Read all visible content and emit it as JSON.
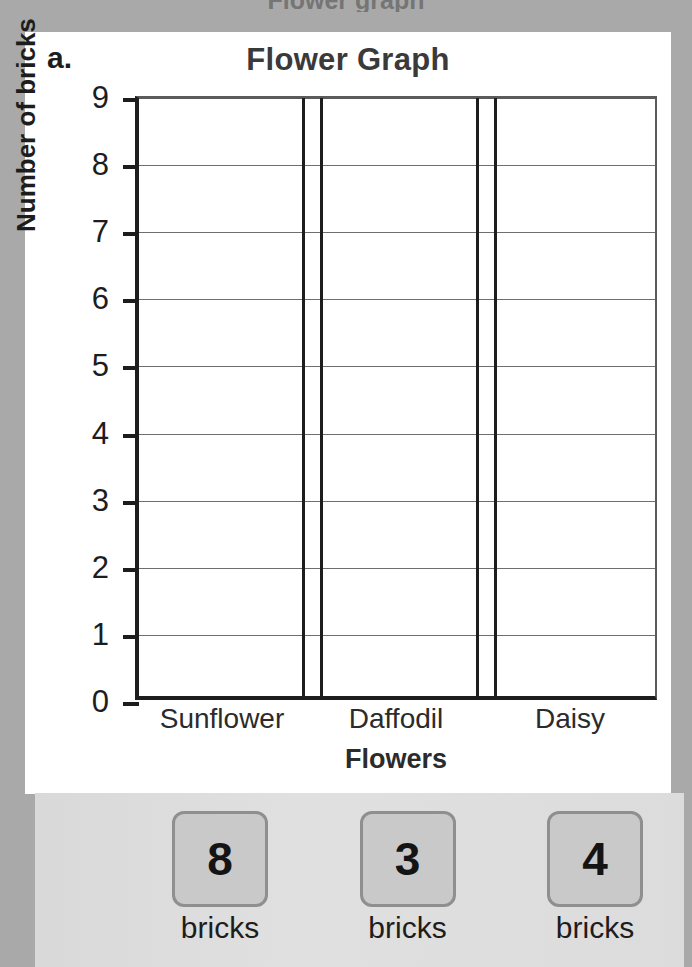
{
  "page": {
    "background_color": "#a9a9a9",
    "card_background": "#ffffff",
    "cropped_top_text": "Flower graph"
  },
  "worksheet": {
    "item_label": "a.",
    "x_axis_title": "Flowers",
    "y_axis_title": "Number of bricks"
  },
  "chart_data": {
    "type": "bar",
    "title": "Flower Graph",
    "xlabel": "Flowers",
    "ylabel": "Number of bricks",
    "categories": [
      "Sunflower",
      "Daffodil",
      "Daisy"
    ],
    "values": [
      0,
      0,
      0
    ],
    "answer_values": [
      8,
      3,
      4
    ],
    "ylim": [
      0,
      9
    ],
    "ytick_labels": [
      "0",
      "1",
      "2",
      "3",
      "4",
      "5",
      "6",
      "7",
      "8",
      "9"
    ],
    "ytick_values": [
      0,
      1,
      2,
      3,
      4,
      5,
      6,
      7,
      8,
      9
    ],
    "grid": true,
    "legend": "none",
    "note": "Blank bar graph; bars are not drawn. Columns are empty and awaiting the values from the answer tiles."
  },
  "tiles": {
    "items": [
      {
        "value": "8",
        "caption": "bricks"
      },
      {
        "value": "3",
        "caption": "bricks"
      },
      {
        "value": "4",
        "caption": "bricks"
      }
    ],
    "panel_color": "#dcdcdc",
    "tile_color": "#c9c9c9",
    "tile_border_color": "#8f8f8f"
  }
}
